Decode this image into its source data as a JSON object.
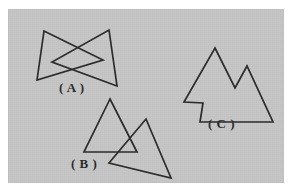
{
  "figure": {
    "background_color": "#ffffff",
    "panel_color": "#c6c6c6",
    "stroke_color": "#2b2b2b",
    "panel": {
      "x": 8,
      "y": 9,
      "width": 276,
      "height": 174
    }
  },
  "labels": {
    "a": "( A )",
    "b": "( B )",
    "c": "( C )"
  },
  "chart_data": {
    "type": "diagram",
    "shapes": [
      {
        "id": "A",
        "label": "( A )",
        "description": "bowtie: two triangles crossing at a point",
        "parts": [
          {
            "name": "left-triangle",
            "points": "44,31 37,80 103,60"
          },
          {
            "name": "right-triangle",
            "points": "109,30 117,86 52,62"
          }
        ]
      },
      {
        "id": "B",
        "label": "( B )",
        "description": "two overlapping triangles",
        "parts": [
          {
            "name": "upper-left-triangle",
            "points": "110,99 84,152 137,152"
          },
          {
            "name": "lower-right-triangle",
            "points": "146,119 171,178 109,163"
          }
        ]
      },
      {
        "id": "C",
        "label": "( C )",
        "description": "concave mountain-shaped polygon",
        "parts": [
          {
            "name": "mountain-polygon",
            "points": "215,48 235,88 247,66 273,122 200,122 203,103 184,102"
          }
        ]
      }
    ]
  }
}
